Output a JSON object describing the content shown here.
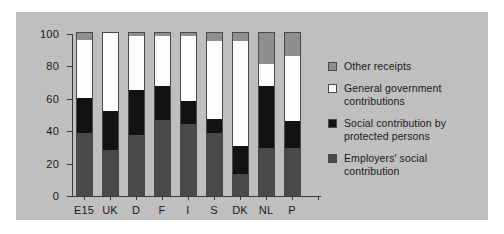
{
  "chart_data": {
    "type": "bar",
    "stacked": true,
    "title": "",
    "subtitle": "",
    "xlabel": "",
    "ylabel": "",
    "categories": [
      "E15",
      "UK",
      "D",
      "F",
      "I",
      "S",
      "DK",
      "NL",
      "P"
    ],
    "ylim": [
      0,
      100
    ],
    "yticks": [
      0,
      20,
      40,
      60,
      80,
      100
    ],
    "ytick_labels": [
      "0",
      "20",
      "40",
      "60",
      "80",
      "100"
    ],
    "grid": false,
    "legend_position": "right",
    "series": [
      {
        "name": "Employers' social contribution",
        "color": "#4a4a4a",
        "values": [
          38,
          28,
          37,
          46,
          44,
          38,
          13,
          29,
          29
        ]
      },
      {
        "name": "Social contribution by protected persons",
        "color": "#121212",
        "values": [
          22,
          24,
          28,
          21,
          14,
          9,
          17,
          38,
          17
        ]
      },
      {
        "name": "General government contributions",
        "color": "#fdfdfd",
        "values": [
          36,
          48,
          33,
          31,
          40,
          48,
          65,
          14,
          40
        ]
      },
      {
        "name": "Other receipts",
        "color": "#8f8f8f",
        "values": [
          4,
          0,
          2,
          2,
          2,
          5,
          5,
          19,
          14
        ]
      }
    ]
  },
  "legend": {
    "items": [
      {
        "label": "Other receipts",
        "swatch": "other"
      },
      {
        "label": "General government contributions",
        "swatch": "government"
      },
      {
        "label": "Social contribution by protected persons",
        "swatch": "protected"
      },
      {
        "label": "Employers' social contribution",
        "swatch": "employers"
      }
    ]
  },
  "colors": {
    "figure_background": "#bfbfbf",
    "page_background": "#ffffff",
    "axis": "#3a3a3a",
    "text": "#1a1a1a"
  }
}
